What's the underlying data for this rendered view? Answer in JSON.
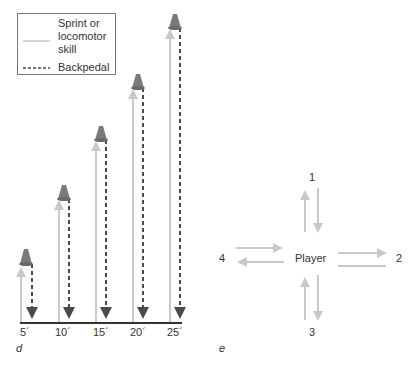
{
  "legend": {
    "solid_label": "Sprint or locomotor skill",
    "solid_line1": "Sprint or",
    "solid_line2": "locomotor",
    "solid_line3": "skill",
    "dashed_label": "Backpedal"
  },
  "panel_d": {
    "letter": "d",
    "distances": [
      {
        "label": "5´",
        "value": 5
      },
      {
        "label": "10´",
        "value": 10
      },
      {
        "label": "15´",
        "value": 15
      },
      {
        "label": "20´",
        "value": 20
      },
      {
        "label": "25´",
        "value": 25
      }
    ]
  },
  "panel_e": {
    "letter": "e",
    "center_label": "Player",
    "positions": {
      "top": "1",
      "right": "2",
      "bottom": "3",
      "left": "4"
    }
  },
  "colors": {
    "sprint_arrow": "#c8c8c8",
    "backpedal_arrow": "#4a4a4a",
    "cone": "#7a7a7a",
    "baseline": "#333333"
  }
}
